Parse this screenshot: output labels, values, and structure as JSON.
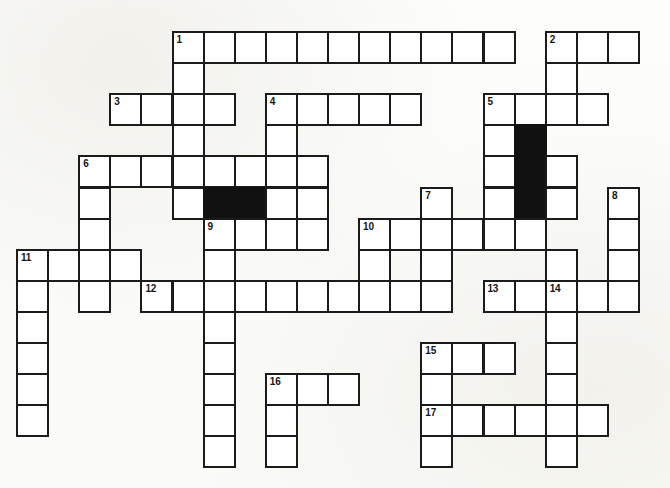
{
  "puzzle": {
    "title": "Crossword Puzzle Grid",
    "type": "crossword-grid",
    "geometry": {
      "origin_x": 16,
      "origin_y": 31,
      "cell_size": 31.1,
      "columns": 21,
      "rows": 14,
      "canvas_width": 670,
      "canvas_height": 488
    },
    "colors": {
      "page_background": "#fdfdfb",
      "cell_fill": "#ffffff",
      "cell_border": "#1b1b1b",
      "blocked_fill": "#111111",
      "number_color": "#151515"
    },
    "entries": [
      {
        "number": "1",
        "direction": "across",
        "col": 5,
        "row": 0,
        "length": 11
      },
      {
        "number": "1",
        "direction": "down",
        "col": 5,
        "row": 0,
        "length": 6
      },
      {
        "number": "2",
        "direction": "across",
        "col": 17,
        "row": 0,
        "length": 3
      },
      {
        "number": "2",
        "direction": "down",
        "col": 17,
        "row": 0,
        "length": 3
      },
      {
        "number": "3",
        "direction": "across",
        "col": 3,
        "row": 2,
        "length": 4
      },
      {
        "number": "4",
        "direction": "across",
        "col": 8,
        "row": 2,
        "length": 5
      },
      {
        "number": "4",
        "direction": "down",
        "col": 8,
        "row": 2,
        "length": 3
      },
      {
        "number": "5",
        "direction": "across",
        "col": 15,
        "row": 2,
        "length": 4
      },
      {
        "number": "5",
        "direction": "down",
        "col": 15,
        "row": 2,
        "length": 5
      },
      {
        "number": "6",
        "direction": "across",
        "col": 2,
        "row": 4,
        "length": 8
      },
      {
        "number": "6",
        "direction": "down",
        "col": 2,
        "row": 4,
        "length": 4
      },
      {
        "number": "7",
        "direction": "down",
        "col": 13,
        "row": 5,
        "length": 4
      },
      {
        "number": "8",
        "direction": "down",
        "col": 19,
        "row": 5,
        "length": 4
      },
      {
        "number": "9",
        "direction": "across",
        "col": 6,
        "row": 6,
        "length": 4
      },
      {
        "number": "9",
        "direction": "down",
        "col": 6,
        "row": 6,
        "length": 8
      },
      {
        "number": "10",
        "direction": "across",
        "col": 11,
        "row": 6,
        "length": 6
      },
      {
        "number": "10",
        "direction": "down",
        "col": 11,
        "row": 6,
        "length": 3
      },
      {
        "number": "11",
        "direction": "across",
        "col": 0,
        "row": 7,
        "length": 4
      },
      {
        "number": "11",
        "direction": "down",
        "col": 0,
        "row": 7,
        "length": 7
      },
      {
        "number": "12",
        "direction": "across",
        "col": 4,
        "row": 8,
        "length": 9
      },
      {
        "number": "13",
        "direction": "across",
        "col": 15,
        "row": 8,
        "length": 5
      },
      {
        "number": "14",
        "direction": "down",
        "col": 17,
        "row": 8,
        "length": 6
      },
      {
        "number": "15",
        "direction": "across",
        "col": 13,
        "row": 10,
        "length": 3
      },
      {
        "number": "15",
        "direction": "down",
        "col": 13,
        "row": 10,
        "length": 4
      },
      {
        "number": "16",
        "direction": "across",
        "col": 8,
        "row": 11,
        "length": 3
      },
      {
        "number": "16",
        "direction": "down",
        "col": 8,
        "row": 11,
        "length": 3
      },
      {
        "number": "17",
        "direction": "across",
        "col": 13,
        "row": 12,
        "length": 6
      }
    ],
    "cells": [
      {
        "col": 5,
        "row": 0,
        "number": "1"
      },
      {
        "col": 6,
        "row": 0
      },
      {
        "col": 7,
        "row": 0
      },
      {
        "col": 8,
        "row": 0
      },
      {
        "col": 9,
        "row": 0
      },
      {
        "col": 10,
        "row": 0
      },
      {
        "col": 11,
        "row": 0
      },
      {
        "col": 12,
        "row": 0
      },
      {
        "col": 13,
        "row": 0
      },
      {
        "col": 14,
        "row": 0
      },
      {
        "col": 15,
        "row": 0
      },
      {
        "col": 17,
        "row": 0,
        "number": "2"
      },
      {
        "col": 18,
        "row": 0
      },
      {
        "col": 19,
        "row": 0
      },
      {
        "col": 5,
        "row": 1
      },
      {
        "col": 17,
        "row": 1
      },
      {
        "col": 3,
        "row": 2,
        "number": "3"
      },
      {
        "col": 4,
        "row": 2
      },
      {
        "col": 5,
        "row": 2
      },
      {
        "col": 6,
        "row": 2
      },
      {
        "col": 8,
        "row": 2,
        "number": "4"
      },
      {
        "col": 9,
        "row": 2
      },
      {
        "col": 10,
        "row": 2
      },
      {
        "col": 11,
        "row": 2
      },
      {
        "col": 12,
        "row": 2
      },
      {
        "col": 15,
        "row": 2,
        "number": "5"
      },
      {
        "col": 16,
        "row": 2
      },
      {
        "col": 17,
        "row": 2
      },
      {
        "col": 18,
        "row": 2
      },
      {
        "col": 5,
        "row": 3
      },
      {
        "col": 8,
        "row": 3
      },
      {
        "col": 15,
        "row": 3
      },
      {
        "col": 16,
        "row": 3,
        "blocked": true
      },
      {
        "col": 2,
        "row": 4,
        "number": "6"
      },
      {
        "col": 3,
        "row": 4
      },
      {
        "col": 4,
        "row": 4
      },
      {
        "col": 5,
        "row": 4
      },
      {
        "col": 6,
        "row": 4
      },
      {
        "col": 7,
        "row": 4
      },
      {
        "col": 8,
        "row": 4
      },
      {
        "col": 9,
        "row": 4
      },
      {
        "col": 15,
        "row": 4
      },
      {
        "col": 16,
        "row": 4,
        "blocked": true
      },
      {
        "col": 17,
        "row": 4
      },
      {
        "col": 2,
        "row": 5
      },
      {
        "col": 5,
        "row": 5
      },
      {
        "col": 6,
        "row": 5,
        "blocked": true
      },
      {
        "col": 7,
        "row": 5,
        "blocked": true
      },
      {
        "col": 8,
        "row": 5
      },
      {
        "col": 9,
        "row": 5
      },
      {
        "col": 13,
        "row": 5,
        "number": "7"
      },
      {
        "col": 15,
        "row": 5
      },
      {
        "col": 16,
        "row": 5,
        "blocked": true
      },
      {
        "col": 17,
        "row": 5
      },
      {
        "col": 19,
        "row": 5,
        "number": "8"
      },
      {
        "col": 2,
        "row": 6
      },
      {
        "col": 6,
        "row": 6,
        "number": "9"
      },
      {
        "col": 7,
        "row": 6
      },
      {
        "col": 8,
        "row": 6
      },
      {
        "col": 9,
        "row": 6
      },
      {
        "col": 11,
        "row": 6,
        "number": "10"
      },
      {
        "col": 12,
        "row": 6
      },
      {
        "col": 13,
        "row": 6
      },
      {
        "col": 14,
        "row": 6
      },
      {
        "col": 15,
        "row": 6
      },
      {
        "col": 16,
        "row": 6
      },
      {
        "col": 19,
        "row": 6
      },
      {
        "col": 0,
        "row": 7,
        "number": "11"
      },
      {
        "col": 1,
        "row": 7
      },
      {
        "col": 2,
        "row": 7
      },
      {
        "col": 3,
        "row": 7
      },
      {
        "col": 6,
        "row": 7
      },
      {
        "col": 11,
        "row": 7
      },
      {
        "col": 13,
        "row": 7
      },
      {
        "col": 17,
        "row": 7
      },
      {
        "col": 19,
        "row": 7
      },
      {
        "col": 0,
        "row": 8
      },
      {
        "col": 2,
        "row": 8
      },
      {
        "col": 4,
        "row": 8,
        "number": "12"
      },
      {
        "col": 5,
        "row": 8
      },
      {
        "col": 6,
        "row": 8
      },
      {
        "col": 7,
        "row": 8
      },
      {
        "col": 8,
        "row": 8
      },
      {
        "col": 9,
        "row": 8
      },
      {
        "col": 10,
        "row": 8
      },
      {
        "col": 11,
        "row": 8
      },
      {
        "col": 12,
        "row": 8
      },
      {
        "col": 13,
        "row": 8
      },
      {
        "col": 15,
        "row": 8,
        "number": "13"
      },
      {
        "col": 16,
        "row": 8
      },
      {
        "col": 17,
        "row": 8,
        "number": "14"
      },
      {
        "col": 18,
        "row": 8
      },
      {
        "col": 19,
        "row": 8
      },
      {
        "col": 0,
        "row": 9
      },
      {
        "col": 6,
        "row": 9
      },
      {
        "col": 17,
        "row": 9
      },
      {
        "col": 0,
        "row": 10
      },
      {
        "col": 6,
        "row": 10
      },
      {
        "col": 13,
        "row": 10,
        "number": "15"
      },
      {
        "col": 14,
        "row": 10
      },
      {
        "col": 15,
        "row": 10
      },
      {
        "col": 17,
        "row": 10
      },
      {
        "col": 0,
        "row": 11
      },
      {
        "col": 6,
        "row": 11
      },
      {
        "col": 8,
        "row": 11,
        "number": "16"
      },
      {
        "col": 9,
        "row": 11
      },
      {
        "col": 10,
        "row": 11
      },
      {
        "col": 13,
        "row": 11
      },
      {
        "col": 17,
        "row": 11
      },
      {
        "col": 0,
        "row": 12
      },
      {
        "col": 6,
        "row": 12
      },
      {
        "col": 8,
        "row": 12
      },
      {
        "col": 13,
        "row": 12,
        "number": "17"
      },
      {
        "col": 14,
        "row": 12
      },
      {
        "col": 15,
        "row": 12
      },
      {
        "col": 16,
        "row": 12
      },
      {
        "col": 17,
        "row": 12
      },
      {
        "col": 18,
        "row": 12
      },
      {
        "col": 6,
        "row": 13
      },
      {
        "col": 8,
        "row": 13
      },
      {
        "col": 13,
        "row": 13
      },
      {
        "col": 17,
        "row": 13
      }
    ]
  }
}
